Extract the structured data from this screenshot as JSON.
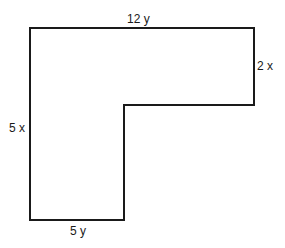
{
  "diagram": {
    "type": "L-shaped polygon",
    "stroke_color": "#1a1a1a",
    "fill_color": "#ffffff",
    "vertices": [
      [
        30,
        28
      ],
      [
        254,
        28
      ],
      [
        254,
        105
      ],
      [
        124,
        105
      ],
      [
        124,
        220
      ],
      [
        30,
        220
      ]
    ],
    "labels": {
      "top": "12 y",
      "right": "2 x",
      "left": "5 x",
      "bottom": "5 y"
    }
  }
}
